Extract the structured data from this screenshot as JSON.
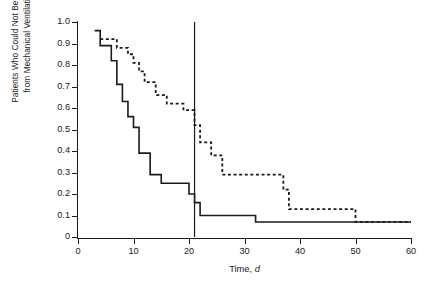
{
  "axes": {
    "ylabel": "Patients Who Could Not Be Weaned\nfrom Mechanical Ventilation, %",
    "xlabel_text": "Time, ",
    "xlabel_italic": "d",
    "y_ticks": [
      "1.0",
      "0.9",
      "0.8",
      "0.7",
      "0.6",
      "0.5",
      "0.4",
      "0.3",
      "0.2",
      "0.1",
      "0"
    ],
    "x_ticks": [
      "0",
      "10",
      "20",
      "30",
      "40",
      "50",
      "60"
    ]
  },
  "chart_data": {
    "type": "line",
    "title": "",
    "xlabel": "Time, d",
    "ylabel": "Patients Who Could Not Be Weaned from Mechanical Ventilation, %",
    "xlim": [
      0,
      60
    ],
    "ylim": [
      0,
      1.0
    ],
    "x_ticks": [
      0,
      10,
      20,
      30,
      40,
      50,
      60
    ],
    "y_ticks": [
      0,
      0.1,
      0.2,
      0.3,
      0.4,
      0.5,
      0.6,
      0.7,
      0.8,
      0.9,
      1.0
    ],
    "grid": false,
    "legend": "none",
    "step_style": "post",
    "annotations": [
      {
        "name": "reference-line",
        "type": "vline",
        "x": 21,
        "y_from": 0,
        "y_to": 1.0,
        "style": "solid"
      }
    ],
    "series": [
      {
        "name": "solid-curve",
        "style": "solid",
        "color": "#1a1a1a",
        "points": [
          {
            "x": 3,
            "y": 0.96
          },
          {
            "x": 4,
            "y": 0.96
          },
          {
            "x": 4,
            "y": 0.89
          },
          {
            "x": 6,
            "y": 0.89
          },
          {
            "x": 6,
            "y": 0.82
          },
          {
            "x": 7,
            "y": 0.82
          },
          {
            "x": 7,
            "y": 0.71
          },
          {
            "x": 8,
            "y": 0.71
          },
          {
            "x": 8,
            "y": 0.63
          },
          {
            "x": 9,
            "y": 0.63
          },
          {
            "x": 9,
            "y": 0.56
          },
          {
            "x": 10,
            "y": 0.56
          },
          {
            "x": 10,
            "y": 0.51
          },
          {
            "x": 11,
            "y": 0.51
          },
          {
            "x": 11,
            "y": 0.39
          },
          {
            "x": 13,
            "y": 0.39
          },
          {
            "x": 13,
            "y": 0.29
          },
          {
            "x": 15,
            "y": 0.29
          },
          {
            "x": 15,
            "y": 0.25
          },
          {
            "x": 20,
            "y": 0.25
          },
          {
            "x": 20,
            "y": 0.2
          },
          {
            "x": 21,
            "y": 0.2
          },
          {
            "x": 21,
            "y": 0.16
          },
          {
            "x": 22,
            "y": 0.16
          },
          {
            "x": 22,
            "y": 0.1
          },
          {
            "x": 32,
            "y": 0.1
          },
          {
            "x": 32,
            "y": 0.07
          },
          {
            "x": 60,
            "y": 0.07
          }
        ]
      },
      {
        "name": "dashed-curve",
        "style": "dashed",
        "color": "#1a1a1a",
        "points": [
          {
            "x": 4,
            "y": 0.92
          },
          {
            "x": 7,
            "y": 0.92
          },
          {
            "x": 7,
            "y": 0.88
          },
          {
            "x": 9,
            "y": 0.88
          },
          {
            "x": 9,
            "y": 0.85
          },
          {
            "x": 10,
            "y": 0.85
          },
          {
            "x": 10,
            "y": 0.81
          },
          {
            "x": 11,
            "y": 0.81
          },
          {
            "x": 11,
            "y": 0.77
          },
          {
            "x": 12,
            "y": 0.77
          },
          {
            "x": 12,
            "y": 0.72
          },
          {
            "x": 14,
            "y": 0.72
          },
          {
            "x": 14,
            "y": 0.66
          },
          {
            "x": 16,
            "y": 0.66
          },
          {
            "x": 16,
            "y": 0.62
          },
          {
            "x": 19,
            "y": 0.62
          },
          {
            "x": 19,
            "y": 0.59
          },
          {
            "x": 21,
            "y": 0.59
          },
          {
            "x": 21,
            "y": 0.52
          },
          {
            "x": 22,
            "y": 0.52
          },
          {
            "x": 22,
            "y": 0.44
          },
          {
            "x": 24,
            "y": 0.44
          },
          {
            "x": 24,
            "y": 0.38
          },
          {
            "x": 26,
            "y": 0.38
          },
          {
            "x": 26,
            "y": 0.29
          },
          {
            "x": 37,
            "y": 0.29
          },
          {
            "x": 37,
            "y": 0.22
          },
          {
            "x": 38,
            "y": 0.22
          },
          {
            "x": 38,
            "y": 0.13
          },
          {
            "x": 50,
            "y": 0.13
          },
          {
            "x": 50,
            "y": 0.07
          },
          {
            "x": 60,
            "y": 0.07
          }
        ]
      }
    ]
  }
}
